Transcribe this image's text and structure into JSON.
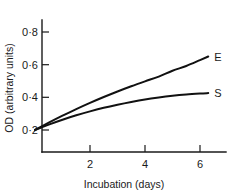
{
  "chart_data": {
    "type": "line",
    "title": "",
    "xlabel": "Incubation (days)",
    "ylabel": "OD (arbitrary units)",
    "xlim": [
      0,
      7
    ],
    "ylim": [
      0.1,
      0.9
    ],
    "grid": false,
    "legend_position": "right-end-of-curve",
    "x_ticks": [
      2,
      4,
      6
    ],
    "x_tick_labels": [
      "2",
      "4",
      "6"
    ],
    "y_ticks": [
      0.2,
      0.4,
      0.6,
      0.8
    ],
    "y_tick_labels": [
      "0·2",
      "0·4",
      "0·6",
      "0·8"
    ],
    "series": [
      {
        "name": "E",
        "label": "E",
        "color": "#111111",
        "x": [
          0,
          0.5,
          1,
          1.5,
          2,
          2.5,
          3,
          3.5,
          4,
          4.5,
          5,
          5.5,
          6,
          6.3
        ],
        "values": [
          0.2,
          0.245,
          0.288,
          0.328,
          0.366,
          0.402,
          0.436,
          0.468,
          0.498,
          0.527,
          0.563,
          0.592,
          0.628,
          0.65
        ]
      },
      {
        "name": "S",
        "label": "S",
        "color": "#111111",
        "x": [
          0,
          0.5,
          1,
          1.5,
          2,
          2.5,
          3,
          3.5,
          4,
          4.5,
          5,
          5.5,
          6,
          6.3
        ],
        "values": [
          0.2,
          0.233,
          0.263,
          0.29,
          0.314,
          0.336,
          0.355,
          0.372,
          0.387,
          0.399,
          0.409,
          0.417,
          0.423,
          0.426
        ]
      }
    ]
  },
  "axes": {
    "y_title": "OD (arbitrary units)",
    "x_title": "Incubation (days)",
    "y_tick_0": "0·8",
    "y_tick_1": "0·6",
    "y_tick_2": "0·4",
    "y_tick_3": "0·2",
    "x_tick_0": "2",
    "x_tick_1": "4",
    "x_tick_2": "6"
  },
  "labels": {
    "series_e": "E",
    "series_s": "S"
  }
}
